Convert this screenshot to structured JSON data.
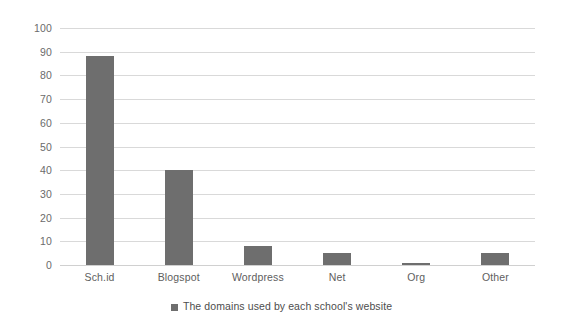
{
  "chart_data": {
    "type": "bar",
    "title": "",
    "subtitle": "",
    "xlabel": "",
    "ylabel": "",
    "categories": [
      "Sch.id",
      "Blogspot",
      "Wordpress",
      "Net",
      "Org",
      "Other"
    ],
    "values": [
      88,
      40,
      8,
      5,
      1,
      5
    ],
    "series": [
      {
        "name": "The domains used by each school's website",
        "values": [
          88,
          40,
          8,
          5,
          1,
          5
        ]
      }
    ],
    "ylim": [
      0,
      100
    ],
    "ytick_step": 10,
    "yticks": [
      0,
      10,
      20,
      30,
      40,
      50,
      60,
      70,
      80,
      90,
      100
    ],
    "ytick_labels": [
      "0",
      "10",
      "20",
      "30",
      "40",
      "50",
      "60",
      "70",
      "80",
      "90",
      "100"
    ],
    "grid": true,
    "grid_axis": "y",
    "legend": {
      "position": "bottom",
      "entries": [
        {
          "label": "The domains used by each school's website",
          "color": "#6e6e6e",
          "marker": "square"
        }
      ]
    },
    "colors": {
      "bar": "#6e6e6e",
      "gridline": "#d9d9d9",
      "background": "#ffffff",
      "tick_text": "#6b6b6b",
      "category_text": "#5e5e5e",
      "legend_text": "#4d4d4d"
    }
  }
}
